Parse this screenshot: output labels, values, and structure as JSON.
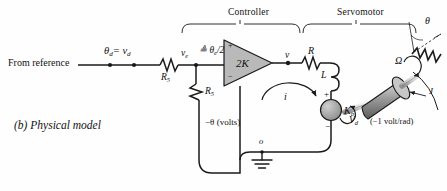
{
  "figure": {
    "caption": "(b)  Physical model",
    "background_color": "#fefefe",
    "line_color": "#1a1a1a",
    "fill_gray": "#b9b9b9",
    "width": 447,
    "height": 191
  },
  "sections": {
    "controller": "Controller",
    "servomotor": "Servomotor"
  },
  "input": {
    "source_text": "From reference",
    "desired_signal": "θ",
    "desired_signal_sub": "d",
    "desired_signal_eq": "= v",
    "desired_signal_eq_sub": "d"
  },
  "components": {
    "r5_label": "R",
    "r5_sub": "5",
    "r3_label": "R",
    "r3_sub": "5",
    "error_voltage": "v",
    "error_voltage_sub": "e",
    "error_def": "≜ θ",
    "error_def_sub": "e",
    "error_def_tail": "/2",
    "amp_gain": "2K",
    "amp_plus": "+",
    "amp_minus": "−",
    "amp_out_node": "v",
    "motor_r": "R",
    "motor_l": "L",
    "current": "i",
    "back_emf": "K",
    "back_emf_sub": "b",
    "back_emf_plus": "+",
    "back_emf_minus": "−",
    "ground_node": "o",
    "feedback_label": "−θ (volts)",
    "motor_voltage": "V",
    "motor_voltage_sub": "d",
    "sensitivity": "(−1 volt/rad)",
    "omega": "Ω",
    "angle": "θ",
    "inertia": "J"
  }
}
